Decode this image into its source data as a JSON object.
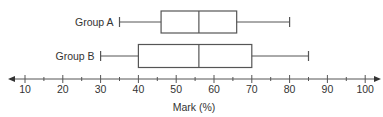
{
  "chart_data": {
    "type": "boxplot",
    "title": "",
    "xlabel": "Mark (%)",
    "ylabel": "",
    "xlim": [
      7,
      103
    ],
    "ticks_major": [
      10,
      20,
      30,
      40,
      50,
      60,
      70,
      80,
      90,
      100
    ],
    "ticks_minor_step": 5,
    "grid": false,
    "series": [
      {
        "name": "Group A",
        "min": 35,
        "q1": 46,
        "median": 56,
        "q3": 66,
        "max": 80
      },
      {
        "name": "Group B",
        "min": 30,
        "q1": 40,
        "median": 56,
        "q3": 70,
        "max": 85
      }
    ],
    "colors": {
      "stroke": "#555555",
      "text": "#333333",
      "background": "#ffffff"
    }
  }
}
